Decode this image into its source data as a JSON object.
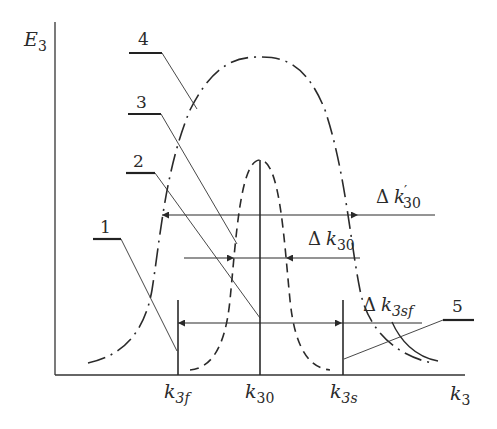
{
  "figure": {
    "axes": {
      "y_label": {
        "base": "E",
        "sub": "3"
      },
      "x_label": {
        "base": "k",
        "sub": "3"
      }
    },
    "ticks": [
      {
        "id": "k3f",
        "base": "k",
        "sub": "3f"
      },
      {
        "id": "k30",
        "base": "k",
        "sub": "30"
      },
      {
        "id": "k3s",
        "base": "k",
        "sub": "3s"
      }
    ],
    "intervals": [
      {
        "id": "delta-k30-prime",
        "delta": "Δ",
        "base": "k",
        "prime": "′",
        "sub": "30"
      },
      {
        "id": "delta-k30",
        "delta": "Δ",
        "base": "k",
        "sub": "30"
      },
      {
        "id": "delta-k3sf",
        "delta": "Δ",
        "base": "k",
        "sub": "3sf"
      }
    ],
    "callouts": [
      {
        "number": "1"
      },
      {
        "number": "2"
      },
      {
        "number": "3"
      },
      {
        "number": "4"
      },
      {
        "number": "5"
      }
    ],
    "colors": {
      "ink": "#2a2a2a",
      "background": "#ffffff"
    }
  }
}
